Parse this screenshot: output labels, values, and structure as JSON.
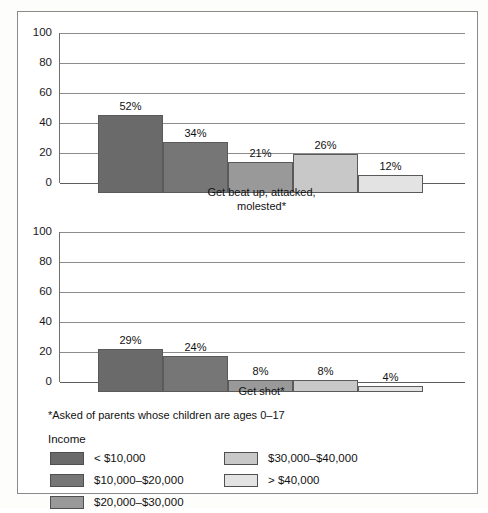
{
  "figure": {
    "footnote": "*Asked of parents whose children are ages 0–17",
    "legend_title": "Income"
  },
  "series_colors": [
    "#6a6a6a",
    "#767676",
    "#999999",
    "#c8c8c8",
    "#e3e3e3"
  ],
  "legend": {
    "column1": [
      {
        "label": "< $10,000",
        "color": "#6a6a6a",
        "swatch_name": "legend-swatch-under-10000"
      },
      {
        "label": "$10,000–$20,000",
        "color": "#767676",
        "swatch_name": "legend-swatch-10000-20000"
      },
      {
        "label": "$20,000–$30,000",
        "color": "#999999",
        "swatch_name": "legend-swatch-20000-30000"
      }
    ],
    "column2": [
      {
        "label": "$30,000–$40,000",
        "color": "#c8c8c8",
        "swatch_name": "legend-swatch-30000-40000"
      },
      {
        "label": "> $40,000",
        "color": "#e3e3e3",
        "swatch_name": "legend-swatch-over-40000"
      }
    ]
  },
  "chart_data": [
    {
      "type": "bar",
      "title": "",
      "xlabel": "Get beat up, attacked, molested*",
      "xlabel_lines": [
        "Get beat up, attacked,",
        "molested*"
      ],
      "ylabel": "",
      "ylim": [
        0,
        100
      ],
      "yticks": [
        100,
        80,
        60,
        40,
        20,
        0
      ],
      "grid": true,
      "legend_position": "bottom",
      "categories": [
        "< $10,000",
        "$10,000–$20,000",
        "$20,000–$30,000",
        "$30,000–$40,000",
        "> $40,000"
      ],
      "values": [
        52,
        34,
        21,
        26,
        12
      ],
      "data_labels": [
        "52%",
        "34%",
        "21%",
        "26%",
        "12%"
      ]
    },
    {
      "type": "bar",
      "title": "",
      "xlabel": "Get shot*",
      "xlabel_lines": [
        "Get shot*"
      ],
      "ylabel": "",
      "ylim": [
        0,
        100
      ],
      "yticks": [
        100,
        80,
        60,
        40,
        20,
        0
      ],
      "grid": true,
      "legend_position": "bottom",
      "categories": [
        "< $10,000",
        "$10,000–$20,000",
        "$20,000–$30,000",
        "$30,000–$40,000",
        "> $40,000"
      ],
      "values": [
        29,
        24,
        8,
        8,
        4
      ],
      "data_labels": [
        "29%",
        "24%",
        "8%",
        "8%",
        "4%"
      ]
    }
  ]
}
